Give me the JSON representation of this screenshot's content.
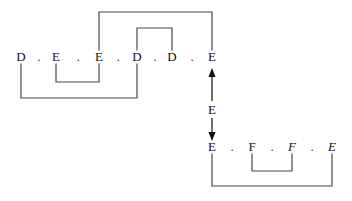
{
  "figure": {
    "background_color": "#ffffff",
    "line_color": "#4a4a4a",
    "text_color": "#121212",
    "dot_separator": "."
  },
  "tiers": [
    {
      "id": "upper-tier",
      "baseline_y": 60,
      "segments": [
        {
          "label": "D",
          "x": 21,
          "italic": false
        },
        {
          "label": "E",
          "x": 56,
          "italic": false
        },
        {
          "label": "E",
          "x": 99,
          "italic": false
        },
        {
          "label": "D",
          "x": 137,
          "italic": false
        },
        {
          "label": "D",
          "x": 172,
          "italic": false
        },
        {
          "label": "E",
          "x": 212,
          "italic": false
        }
      ],
      "separators": [
        {
          "label": ".",
          "x": 39
        },
        {
          "label": ".",
          "x": 78
        },
        {
          "label": ".",
          "x": 118
        },
        {
          "label": ".",
          "x": 155
        },
        {
          "label": ".",
          "x": 192
        }
      ]
    },
    {
      "id": "lower-tier",
      "baseline_y": 150,
      "segments": [
        {
          "label": "E",
          "x": 212,
          "italic": false
        },
        {
          "label": "F",
          "x": 252,
          "italic": false
        },
        {
          "label": "F",
          "x": 292,
          "italic": true
        },
        {
          "label": "E",
          "x": 332,
          "italic": true
        }
      ],
      "separators": [
        {
          "label": ".",
          "x": 232
        },
        {
          "label": ".",
          "x": 272
        },
        {
          "label": ".",
          "x": 312
        }
      ]
    }
  ],
  "associations": [
    {
      "name": "upper-outer-top-link",
      "side": "above",
      "from_x": 99,
      "to_x": 212,
      "depth_y": 12
    },
    {
      "name": "upper-inner-top-link",
      "side": "above",
      "from_x": 137,
      "to_x": 172,
      "depth_y": 28
    },
    {
      "name": "upper-outer-bottom-link",
      "side": "below",
      "from_x": 21,
      "to_x": 137,
      "depth_y": 98
    },
    {
      "name": "upper-inner-bottom-link",
      "side": "below",
      "from_x": 56,
      "to_x": 99,
      "depth_y": 82
    },
    {
      "name": "lower-outer-bottom-link",
      "side": "below",
      "from_x": 212,
      "to_x": 332,
      "depth_y": 186
    },
    {
      "name": "lower-inner-bottom-link",
      "side": "below",
      "from_x": 252,
      "to_x": 292,
      "depth_y": 171
    }
  ],
  "arrow": {
    "name": "bidirectional-derivation-arrow",
    "x": 212,
    "top_y": 68,
    "bottom_y": 141,
    "label": "E",
    "label_y": 108,
    "heads": "both"
  }
}
